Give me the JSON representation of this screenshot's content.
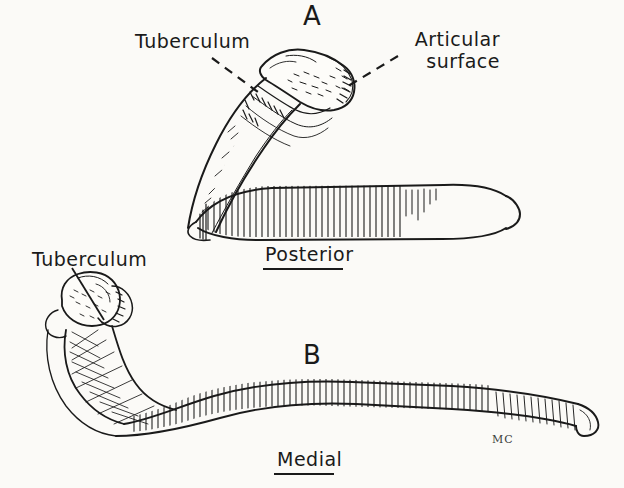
{
  "figure": {
    "background_color": "#fbfaf7",
    "ink_color": "#1a1a1a",
    "signature": "MC"
  },
  "panels": [
    {
      "id": "A",
      "letter": "A",
      "view_label": "Posterior",
      "callouts": [
        {
          "id": "tuberculum-a",
          "text": "Tuberculum",
          "leader": "dashed"
        },
        {
          "id": "articular-surface-a",
          "line1": "Articular",
          "line2": "surface",
          "leader": "dashed"
        }
      ]
    },
    {
      "id": "B",
      "letter": "B",
      "view_label": "Medial",
      "callouts": [
        {
          "id": "tuberculum-b",
          "text": "Tuberculum",
          "leader": "solid"
        }
      ]
    }
  ],
  "labels": {
    "panel_a_letter": "A",
    "panel_b_letter": "B",
    "tuberculum_a": "Tuberculum",
    "articular_line1": "Articular",
    "articular_line2": "surface",
    "tuberculum_b": "Tuberculum",
    "posterior": "Posterior",
    "medial": "Medial",
    "signature": "MC"
  }
}
